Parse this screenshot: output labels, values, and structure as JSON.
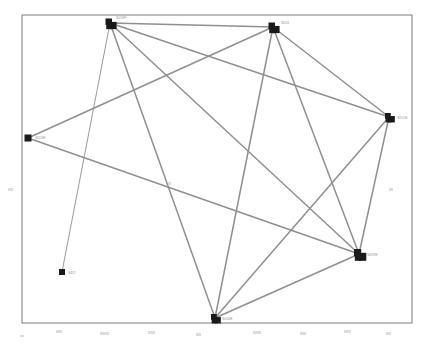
{
  "diagram": {
    "type": "node-link-graph",
    "frame": {
      "x": 22,
      "y": 15,
      "width": 390,
      "height": 308
    },
    "colors": {
      "node": "#1a1a1a",
      "edge": "#8f8f8f",
      "frame": "#7d7d7d",
      "label": "#8d8d8d",
      "background": "#ffffff"
    },
    "nodes": [
      {
        "id": "n1",
        "label": "3018F",
        "x": 110,
        "y": 23,
        "size": 9,
        "shape": "cluster",
        "label_dx": 6,
        "label_dy": -5
      },
      {
        "id": "n2",
        "label": "3014",
        "x": 273,
        "y": 27,
        "size": 9,
        "shape": "cluster",
        "label_dx": 8,
        "label_dy": -4
      },
      {
        "id": "n3",
        "label": "3015E",
        "x": 389,
        "y": 117,
        "size": 8,
        "shape": "cluster",
        "label_dx": 8,
        "label_dy": 1
      },
      {
        "id": "n4",
        "label": "3013E",
        "x": 28,
        "y": 138,
        "size": 7,
        "shape": "square",
        "label_dx": 7,
        "label_dy": 0
      },
      {
        "id": "n5",
        "label": "3019E",
        "x": 359,
        "y": 254,
        "size": 10,
        "shape": "cluster",
        "label_dx": 8,
        "label_dy": 1
      },
      {
        "id": "n6",
        "label": "3417",
        "x": 62,
        "y": 272,
        "size": 6,
        "shape": "square",
        "label_dx": 6,
        "label_dy": 1
      },
      {
        "id": "n7",
        "label": "3016E",
        "x": 215,
        "y": 318,
        "size": 8,
        "shape": "cluster",
        "label_dx": 7,
        "label_dy": 1
      }
    ],
    "edges": [
      {
        "from": "n1",
        "to": "n2",
        "weight": "normal"
      },
      {
        "from": "n1",
        "to": "n3",
        "weight": "normal"
      },
      {
        "from": "n1",
        "to": "n5",
        "weight": "normal"
      },
      {
        "from": "n1",
        "to": "n7",
        "weight": "normal"
      },
      {
        "from": "n1",
        "to": "n6",
        "weight": "thin"
      },
      {
        "from": "n2",
        "to": "n4",
        "weight": "normal"
      },
      {
        "from": "n2",
        "to": "n3",
        "weight": "normal"
      },
      {
        "from": "n2",
        "to": "n5",
        "weight": "normal"
      },
      {
        "from": "n2",
        "to": "n7",
        "weight": "normal"
      },
      {
        "from": "n3",
        "to": "n5",
        "weight": "normal"
      },
      {
        "from": "n3",
        "to": "n7",
        "weight": "normal"
      },
      {
        "from": "n4",
        "to": "n5",
        "weight": "normal"
      },
      {
        "from": "n5",
        "to": "n7",
        "weight": "normal"
      }
    ],
    "specks": [
      {
        "x": 8,
        "y": 188,
        "w": 5,
        "h": 3
      },
      {
        "x": 168,
        "y": 182,
        "w": 3,
        "h": 3
      },
      {
        "x": 389,
        "y": 188,
        "w": 4,
        "h": 3
      },
      {
        "x": 56,
        "y": 330,
        "w": 6,
        "h": 3
      },
      {
        "x": 100,
        "y": 332,
        "w": 9,
        "h": 3
      },
      {
        "x": 148,
        "y": 331,
        "w": 7,
        "h": 3
      },
      {
        "x": 196,
        "y": 333,
        "w": 5,
        "h": 3
      },
      {
        "x": 253,
        "y": 331,
        "w": 8,
        "h": 3
      },
      {
        "x": 300,
        "y": 332,
        "w": 6,
        "h": 3
      },
      {
        "x": 344,
        "y": 330,
        "w": 7,
        "h": 3
      },
      {
        "x": 386,
        "y": 332,
        "w": 5,
        "h": 3
      },
      {
        "x": 20,
        "y": 335,
        "w": 4,
        "h": 2
      }
    ]
  }
}
